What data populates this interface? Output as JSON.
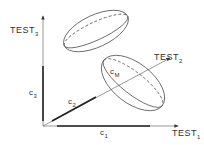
{
  "axes": {
    "x": {
      "label": "TEST",
      "sub": "1"
    },
    "y": {
      "label": "TEST",
      "sub": "2"
    },
    "z": {
      "label": "TEST",
      "sub": "3"
    }
  },
  "components": {
    "c1": {
      "label": "c",
      "sub": "1"
    },
    "c2": {
      "label": "c",
      "sub": "2"
    },
    "c3": {
      "label": "c",
      "sub": "3"
    },
    "cm": {
      "label": "c",
      "sub": "M"
    }
  },
  "colors": {
    "line": "#333333",
    "background": "#ffffff"
  }
}
